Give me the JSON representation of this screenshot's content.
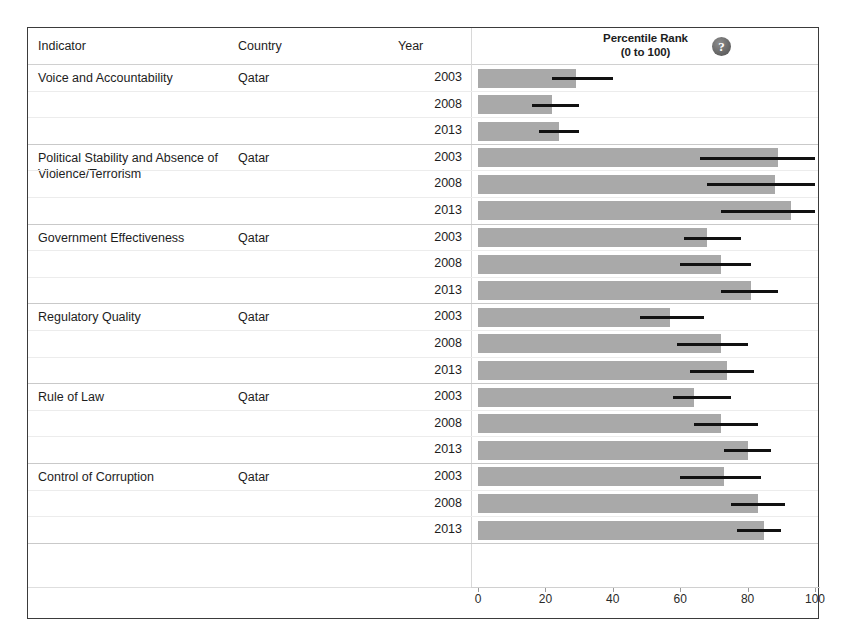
{
  "table": {
    "columns": {
      "indicator": "Indicator",
      "country": "Country",
      "year": "Year"
    },
    "chart_header": {
      "line1": "Percentile Rank",
      "line2": "(0 to 100)",
      "help_icon": "help-icon",
      "help_glyph": "?"
    }
  },
  "colors": {
    "bar": "#a9a9a9",
    "confidence_interval": "#111111",
    "frame": "#3b3b3b",
    "row_separator": "#ececec",
    "group_separator": "#c9c9c9",
    "text": "#1d1d1d"
  },
  "chart_data": {
    "type": "bar",
    "orientation": "horizontal",
    "title": "Percentile Rank (0 to 100)",
    "xlabel": "",
    "ylabel": "",
    "xlim": [
      0,
      100
    ],
    "xticks": [
      0,
      20,
      40,
      60,
      80,
      100
    ],
    "grid": false,
    "legend": false,
    "error_bars": "90% confidence interval",
    "country": "Qatar",
    "groups": [
      {
        "indicator": "Voice and Accountability",
        "country": "Qatar",
        "rows": [
          {
            "year": "2003",
            "value": 29,
            "ci_low": 22,
            "ci_high": 40
          },
          {
            "year": "2008",
            "value": 22,
            "ci_low": 16,
            "ci_high": 30
          },
          {
            "year": "2013",
            "value": 24,
            "ci_low": 18,
            "ci_high": 30
          }
        ]
      },
      {
        "indicator": "Political Stability and Absence of Violence/Terrorism",
        "country": "Qatar",
        "rows": [
          {
            "year": "2003",
            "value": 89,
            "ci_low": 66,
            "ci_high": 100
          },
          {
            "year": "2008",
            "value": 88,
            "ci_low": 68,
            "ci_high": 100
          },
          {
            "year": "2013",
            "value": 93,
            "ci_low": 72,
            "ci_high": 100
          }
        ]
      },
      {
        "indicator": "Government Effectiveness",
        "country": "Qatar",
        "rows": [
          {
            "year": "2003",
            "value": 68,
            "ci_low": 61,
            "ci_high": 78
          },
          {
            "year": "2008",
            "value": 72,
            "ci_low": 60,
            "ci_high": 81
          },
          {
            "year": "2013",
            "value": 81,
            "ci_low": 72,
            "ci_high": 89
          }
        ]
      },
      {
        "indicator": "Regulatory Quality",
        "country": "Qatar",
        "rows": [
          {
            "year": "2003",
            "value": 57,
            "ci_low": 48,
            "ci_high": 67
          },
          {
            "year": "2008",
            "value": 72,
            "ci_low": 59,
            "ci_high": 80
          },
          {
            "year": "2013",
            "value": 74,
            "ci_low": 63,
            "ci_high": 82
          }
        ]
      },
      {
        "indicator": "Rule of Law",
        "country": "Qatar",
        "rows": [
          {
            "year": "2003",
            "value": 64,
            "ci_low": 58,
            "ci_high": 75
          },
          {
            "year": "2008",
            "value": 72,
            "ci_low": 64,
            "ci_high": 83
          },
          {
            "year": "2013",
            "value": 80,
            "ci_low": 73,
            "ci_high": 87
          }
        ]
      },
      {
        "indicator": "Control of Corruption",
        "country": "Qatar",
        "rows": [
          {
            "year": "2003",
            "value": 73,
            "ci_low": 60,
            "ci_high": 84
          },
          {
            "year": "2008",
            "value": 83,
            "ci_low": 75,
            "ci_high": 91
          },
          {
            "year": "2013",
            "value": 85,
            "ci_low": 77,
            "ci_high": 90
          }
        ]
      }
    ]
  }
}
